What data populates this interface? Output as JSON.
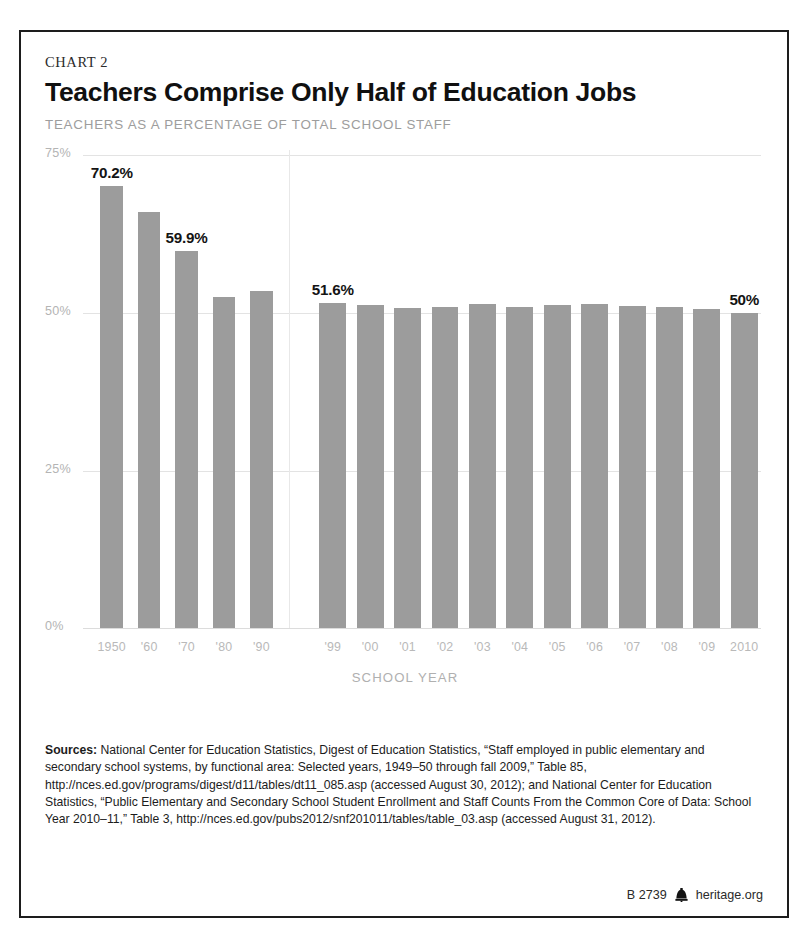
{
  "card": {
    "kicker": "CHART 2",
    "headline": "Teachers Comprise Only Half of Education Jobs",
    "subhead": "TEACHERS AS A PERCENTAGE OF TOTAL SCHOOL STAFF"
  },
  "chart_data": {
    "type": "bar",
    "title": "Teachers Comprise Only Half of Education Jobs",
    "subtitle": "TEACHERS AS A PERCENTAGE OF TOTAL SCHOOL STAFF",
    "xlabel": "SCHOOL YEAR",
    "ylabel": "",
    "ylim": [
      0,
      75
    ],
    "yticks": [
      0,
      25,
      50,
      75
    ],
    "ytick_labels": [
      "0%",
      "25%",
      "50%",
      "75%"
    ],
    "grid": true,
    "legend": "none",
    "bar_color": "#9c9c9c",
    "categories": [
      "1950",
      "'60",
      "'70",
      "'80",
      "'90",
      "'99",
      "'00",
      "'01",
      "'02",
      "'03",
      "'04",
      "'05",
      "'06",
      "'07",
      "'08",
      "'09",
      "2010"
    ],
    "values": [
      70.2,
      66.0,
      59.9,
      52.5,
      53.5,
      51.6,
      51.3,
      50.8,
      51.0,
      51.4,
      50.9,
      51.3,
      51.5,
      51.1,
      51.0,
      50.7,
      50.0
    ],
    "point_labels": {
      "1950": "70.2%",
      "'70": "59.9%",
      "'99": "51.6%",
      "2010": "50%"
    },
    "group_break_after_index": 4,
    "annotations": [
      "70.2%",
      "59.9%",
      "51.6%",
      "50%"
    ]
  },
  "footer": {
    "sources_label": "Sources:",
    "sources_text": " National Center for Education Statistics, Digest of Education Statistics, “Staff employed in public elementary and secondary school systems, by functional area: Selected years, 1949–50 through fall 2009,” Table 85, http://nces.ed.gov/programs/digest/d11/tables/dt11_085.asp (accessed August 30, 2012); and National Center for Education Statistics, “Public Elementary and Secondary School Student Enrollment and Staff Counts From the Common Core of Data: School Year 2010–11,” Table 3, http://nces.ed.gov/pubs2012/snf201011/tables/table_03.asp (accessed August 31, 2012).",
    "chart_id": "B 2739",
    "site": "heritage.org",
    "bell_icon": "liberty-bell-icon"
  }
}
